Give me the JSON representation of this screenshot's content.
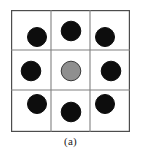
{
  "figure": {
    "caption": "(a)",
    "grid": {
      "rows": 3,
      "cols": 3,
      "x0": 11,
      "y0": 10,
      "x1": 130,
      "y1": 132,
      "v_lines": [
        51,
        90
      ],
      "h_lines": [
        50,
        90
      ],
      "border_color": "#4d4d4d",
      "line_color": "#808080",
      "border_width": 1.2,
      "line_width": 1.1,
      "fill": "#ffffff"
    },
    "circles": [
      {
        "id": "neighbor-top-left",
        "cx": 37,
        "cy": 37,
        "r": 9.5,
        "fill": "#0d0d0d",
        "stroke": "#0d0d0d",
        "role": "neighbor"
      },
      {
        "id": "neighbor-top-center",
        "cx": 71,
        "cy": 31,
        "r": 9.8,
        "fill": "#0d0d0d",
        "stroke": "#0d0d0d",
        "role": "neighbor"
      },
      {
        "id": "neighbor-top-right",
        "cx": 105,
        "cy": 37,
        "r": 9.5,
        "fill": "#0d0d0d",
        "stroke": "#0d0d0d",
        "role": "neighbor"
      },
      {
        "id": "neighbor-middle-left",
        "cx": 31,
        "cy": 71,
        "r": 9.8,
        "fill": "#0d0d0d",
        "stroke": "#0d0d0d",
        "role": "neighbor"
      },
      {
        "id": "center-pixel",
        "cx": 71,
        "cy": 71,
        "r": 9.8,
        "fill": "#8f8f8f",
        "stroke": "#3a3a3a",
        "role": "center"
      },
      {
        "id": "neighbor-middle-right",
        "cx": 111,
        "cy": 71,
        "r": 9.8,
        "fill": "#0d0d0d",
        "stroke": "#0d0d0d",
        "role": "neighbor"
      },
      {
        "id": "neighbor-bottom-left",
        "cx": 37,
        "cy": 104,
        "r": 9.5,
        "fill": "#0d0d0d",
        "stroke": "#0d0d0d",
        "role": "neighbor"
      },
      {
        "id": "neighbor-bottom-center",
        "cx": 71,
        "cy": 112,
        "r": 9.8,
        "fill": "#0d0d0d",
        "stroke": "#0d0d0d",
        "role": "neighbor"
      },
      {
        "id": "neighbor-bottom-right",
        "cx": 105,
        "cy": 104,
        "r": 9.5,
        "fill": "#0d0d0d",
        "stroke": "#0d0d0d",
        "role": "neighbor"
      }
    ]
  }
}
